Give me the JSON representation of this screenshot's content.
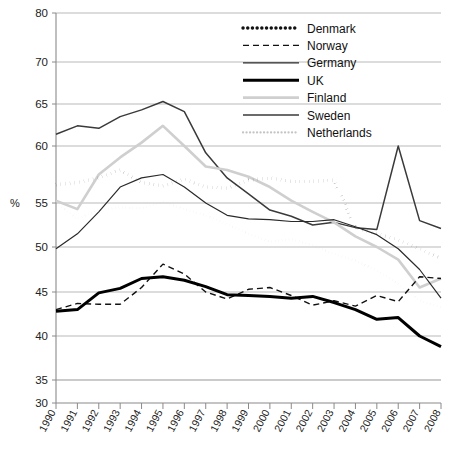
{
  "chart_data": {
    "type": "line",
    "title": "",
    "xlabel": "",
    "ylabel": "%",
    "ylim": [
      30,
      80
    ],
    "grid": true,
    "legend_position": "top-center-right",
    "y_ticks": [
      30,
      35,
      40,
      45,
      50,
      55,
      60,
      65,
      70,
      80
    ],
    "x": [
      1990,
      1991,
      1992,
      1993,
      1994,
      1995,
      1996,
      1997,
      1998,
      1999,
      2000,
      2001,
      2002,
      2003,
      2004,
      2005,
      2006,
      2007,
      2008
    ],
    "categories": [
      "1990",
      "1991",
      "1992",
      "1993",
      "1994",
      "1995",
      "1996",
      "1997",
      "1998",
      "1999",
      "2000",
      "2001",
      "2002",
      "2003",
      "2004",
      "2005",
      "2006",
      "2007",
      "2008"
    ],
    "series": [
      {
        "name": "Denmark",
        "style": "bold-dotted",
        "color": "#111111",
        "values": [
          56.6,
          56.8,
          57.2,
          57.9,
          56.8,
          56.5,
          57.1,
          56.4,
          56.3,
          57.0,
          57.2,
          56.9,
          56.9,
          57.0,
          52.2,
          51.5,
          50.8,
          49.8,
          48.7
        ]
      },
      {
        "name": "Norway",
        "style": "dashed",
        "color": "#111111",
        "values": [
          43.0,
          43.7,
          43.6,
          43.6,
          45.5,
          48.1,
          47.0,
          45.0,
          44.2,
          45.3,
          45.5,
          44.6,
          43.5,
          44.0,
          43.4,
          44.6,
          43.9,
          46.7,
          46.5
        ]
      },
      {
        "name": "Germany",
        "style": "thin-solid",
        "color": "#2a2a2a",
        "values": [
          49.8,
          51.5,
          54.0,
          56.4,
          57.2,
          57.5,
          56.4,
          55.0,
          53.6,
          53.2,
          53.1,
          52.9,
          52.9,
          53.1,
          52.3,
          51.4,
          49.8,
          47.5,
          44.3
        ]
      },
      {
        "name": "UK",
        "style": "thick-solid",
        "color": "#000000",
        "values": [
          42.8,
          43.0,
          44.9,
          45.4,
          46.5,
          46.7,
          46.3,
          45.6,
          44.7,
          44.6,
          44.5,
          44.3,
          44.5,
          43.8,
          43.0,
          41.9,
          42.1,
          40.0,
          38.8
        ]
      },
      {
        "name": "Finland",
        "style": "light-solid",
        "color": "#cfcfcf",
        "values": [
          55.2,
          54.3,
          57.5,
          59.0,
          60.4,
          62.4,
          60.0,
          58.2,
          57.9,
          57.3,
          56.4,
          55.2,
          54.0,
          52.8,
          51.2,
          50.0,
          48.6,
          45.5,
          46.5
        ]
      },
      {
        "name": "Sweden",
        "style": "medium-solid",
        "color": "#3a3a3a",
        "values": [
          61.4,
          62.4,
          62.1,
          63.5,
          64.3,
          65.3,
          64.1,
          59.4,
          57.2,
          55.8,
          54.2,
          53.5,
          52.5,
          52.8,
          52.2,
          52.0,
          60.0,
          53.0,
          52.1
        ]
      },
      {
        "name": "Netherlands",
        "style": "light-dotted",
        "color": "#c4c4c4",
        "values": [
          55.0,
          53.2,
          54.2,
          54.5,
          54.4,
          55.1,
          54.3,
          53.6,
          52.6,
          51.5,
          50.6,
          50.9,
          50.2,
          49.2,
          48.5,
          47.4,
          45.9,
          44.0,
          43.3
        ]
      }
    ]
  },
  "legend": {
    "items": [
      {
        "label": "Denmark"
      },
      {
        "label": "Norway"
      },
      {
        "label": "Germany"
      },
      {
        "label": "UK"
      },
      {
        "label": "Finland"
      },
      {
        "label": "Sweden"
      },
      {
        "label": "Netherlands"
      }
    ]
  }
}
